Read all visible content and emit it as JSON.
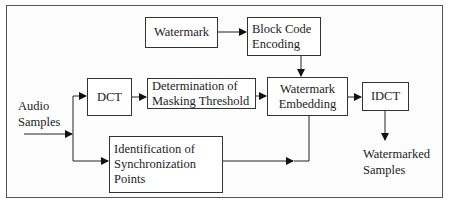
{
  "diagram": {
    "input_label": [
      "Audio",
      "Samples"
    ],
    "output_label": [
      "Watermarked",
      "Samples"
    ],
    "blocks": {
      "watermark": [
        "Watermark"
      ],
      "block_code_encoding": [
        "Block Code",
        "Encoding"
      ],
      "dct": [
        "DCT"
      ],
      "masking_threshold": [
        "Determination of",
        "Masking Threshold"
      ],
      "watermark_embedding": [
        "Watermark",
        "Embedding"
      ],
      "idct": [
        "IDCT"
      ],
      "sync_points": [
        "Identification of",
        "Synchronization",
        "Points"
      ]
    },
    "edges": [
      {
        "from": "Audio Samples",
        "to": "DCT"
      },
      {
        "from": "Audio Samples",
        "to": "Identification of Synchronization Points"
      },
      {
        "from": "Watermark",
        "to": "Block Code Encoding"
      },
      {
        "from": "Block Code Encoding",
        "to": "Watermark Embedding"
      },
      {
        "from": "DCT",
        "to": "Determination of Masking Threshold"
      },
      {
        "from": "Determination of Masking Threshold",
        "to": "Watermark Embedding"
      },
      {
        "from": "Identification of Synchronization Points",
        "to": "Watermark Embedding"
      },
      {
        "from": "Watermark Embedding",
        "to": "IDCT"
      },
      {
        "from": "IDCT",
        "to": "Watermarked Samples"
      }
    ],
    "colors": {
      "line": "#222222",
      "frame": "#555555",
      "background": "#ffffff"
    }
  }
}
